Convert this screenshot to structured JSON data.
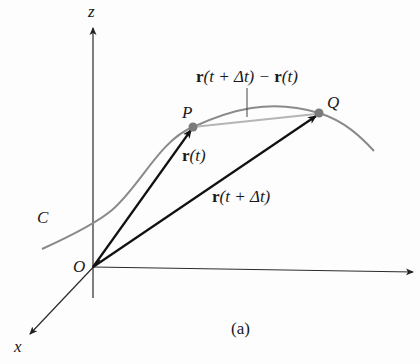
{
  "figure": {
    "caption": "(a)",
    "axes": {
      "z_label": "z",
      "x_label": "x",
      "origin_label": "O"
    },
    "curve_label": "C",
    "points": {
      "P": "P",
      "Q": "Q"
    },
    "vectors": {
      "r_t": {
        "bold": "r",
        "rest": "(t)"
      },
      "r_t_dt": {
        "bold": "r",
        "rest": "(t + Δt)"
      },
      "difference": {
        "bold1": "r",
        "mid": "(t + Δt) − ",
        "bold2": "r",
        "rest": "(t)"
      }
    },
    "colors": {
      "axis": "#2a2a2a",
      "vector": "#111111",
      "curve": "#8a8a8a",
      "chord": "#b5b5b5",
      "point": "#7a7a7a"
    }
  }
}
